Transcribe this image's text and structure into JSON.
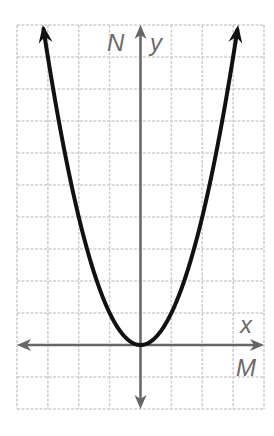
{
  "chart_data": {
    "type": "line",
    "title": "",
    "function": "y = x^2",
    "xlabel": "x",
    "ylabel": "y",
    "axis_names": {
      "vertical": "N",
      "horizontal": "M"
    },
    "xlim": [
      -4,
      4
    ],
    "ylim": [
      -2,
      10
    ],
    "grid": true,
    "tick_labels": false,
    "series": [
      {
        "name": "parabola",
        "x": [
          -3.16,
          -3,
          -2,
          -1,
          0,
          1,
          2,
          3,
          3.16
        ],
        "y": [
          10,
          9,
          4,
          1,
          0,
          1,
          4,
          9,
          10
        ]
      }
    ],
    "vertex": [
      0,
      0
    ],
    "arrows_on_curve_ends": true
  },
  "labels": {
    "n": "N",
    "y": "y",
    "x": "x",
    "m": "M"
  },
  "colors": {
    "grid": "#cfcfcf",
    "axis": "#666666",
    "curve": "#111111",
    "label": "#6a6a6a"
  }
}
